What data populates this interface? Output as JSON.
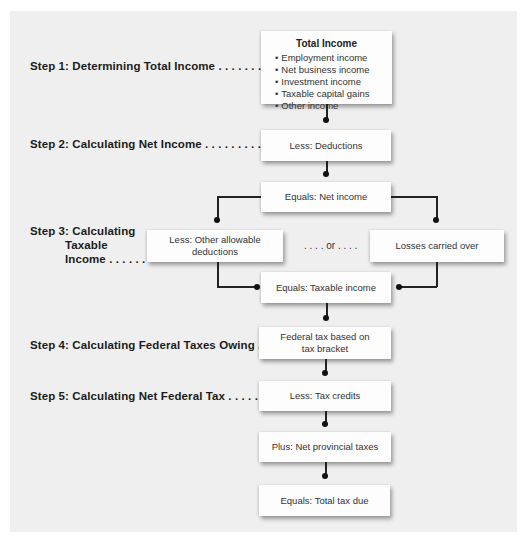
{
  "steps": [
    {
      "label": "Step 1: Determining Total Income . . . . . . . . . . ."
    },
    {
      "label": "Step 2: Calculating Net Income . . . . . . . . . . . . ."
    },
    {
      "label_lines": [
        "Step 3: Calculating",
        "Taxable",
        "Income . . . . . ."
      ]
    },
    {
      "label": "Step 4: Calculating Federal Taxes Owing . . . ."
    },
    {
      "label": "Step 5: Calculating Net Federal Tax . . . . . . . . ."
    }
  ],
  "total_income": {
    "title": "Total Income",
    "items": [
      "Employment income",
      "Net business income",
      "Investment income",
      "Taxable capital gains",
      "Other income"
    ]
  },
  "boxes": {
    "deductions": "Less: Deductions",
    "net_income": "Equals: Net income",
    "other_deductions": "Less: Other allowable deductions",
    "or_text": ". . . . or . . . .",
    "losses": "Losses carried over",
    "taxable_income": "Equals: Taxable income",
    "federal_tax_line1": "Federal tax based on",
    "federal_tax_line2": "tax bracket",
    "tax_credits": "Less: Tax credits",
    "provincial": "Plus: Net provincial taxes",
    "total_due": "Equals: Total tax due"
  }
}
